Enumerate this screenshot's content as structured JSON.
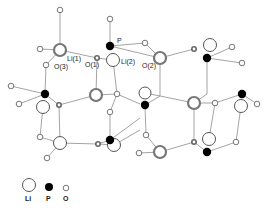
{
  "diagram": {
    "title": "",
    "labels": {
      "li1": "Li(1)",
      "li2": "Li(2)",
      "p": "P",
      "o1": "O(1)",
      "o2": "O(2)",
      "o3": "O(3)"
    },
    "legend": {
      "li": "Li",
      "p": "P",
      "o": "O"
    },
    "colors": {
      "phosphorus": "#000000",
      "lithium_outline": "#555555",
      "oxygen_outline": "#666666",
      "bond": "#9a9a9a"
    }
  }
}
